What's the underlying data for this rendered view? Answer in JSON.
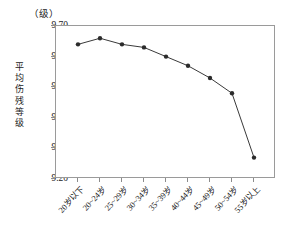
{
  "chart_data": {
    "type": "line",
    "title": "",
    "unit_label": "（级）",
    "ylabel": "平均伤残等级",
    "xlabel": "",
    "ylim": [
      9.2,
      9.7
    ],
    "ytick_labels": [
      "9.70",
      "9.60",
      "9.50",
      "9.40",
      "9.30",
      "9.20"
    ],
    "ytick_values": [
      9.7,
      9.6,
      9.5,
      9.4,
      9.3,
      9.2
    ],
    "grid": false,
    "legend": "none",
    "marker": "filled-circle",
    "line_color": "#3a3a3a",
    "marker_color": "#2b2b2b",
    "frame_color": "#9a9a9a",
    "categories": [
      "20岁以下",
      "20~24岁",
      "25~29岁",
      "30~34岁",
      "35~39岁",
      "40~44岁",
      "45~49岁",
      "50~54岁",
      "55岁以上"
    ],
    "values": [
      9.64,
      9.66,
      9.64,
      9.63,
      9.6,
      9.57,
      9.53,
      9.48,
      9.27
    ],
    "series": [
      {
        "name": "平均伤残等级",
        "values": [
          9.64,
          9.66,
          9.64,
          9.63,
          9.6,
          9.57,
          9.53,
          9.48,
          9.27
        ]
      }
    ]
  },
  "y_axis_title_chars": [
    "平",
    "均",
    "伤",
    "残",
    "等",
    "级"
  ]
}
